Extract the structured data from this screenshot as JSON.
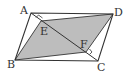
{
  "diagram": {
    "type": "geometry",
    "colors": {
      "stroke": "#333333",
      "shade": "#bdbdbd",
      "background": "#ffffff"
    },
    "points": {
      "A": {
        "label": "A",
        "x": 31,
        "y": 13
      },
      "B": {
        "label": "B",
        "x": 15,
        "y": 60
      },
      "C": {
        "label": "C",
        "x": 98,
        "y": 61
      },
      "D": {
        "label": "D",
        "x": 113,
        "y": 14
      },
      "E": {
        "label": "E",
        "x": 41,
        "y": 21
      },
      "F": {
        "label": "F",
        "x": 86,
        "y": 52
      }
    },
    "segments": [
      "AB",
      "BC",
      "CD",
      "DA",
      "AC",
      "BE",
      "ED",
      "DF",
      "FB"
    ],
    "right_angles": [
      "E",
      "F"
    ],
    "shaded_region": "BEDF"
  }
}
